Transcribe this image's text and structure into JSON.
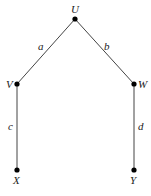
{
  "diagram": {
    "type": "tree",
    "nodes": [
      {
        "id": "U",
        "label": "U",
        "x": 75,
        "y": 19
      },
      {
        "id": "V",
        "label": "V",
        "x": 17,
        "y": 84
      },
      {
        "id": "W",
        "label": "W",
        "x": 134,
        "y": 84
      },
      {
        "id": "X",
        "label": "X",
        "x": 17,
        "y": 170
      },
      {
        "id": "Y",
        "label": "Y",
        "x": 134,
        "y": 170
      }
    ],
    "edges": [
      {
        "from": "U",
        "to": "V",
        "label": "a"
      },
      {
        "from": "U",
        "to": "W",
        "label": "b"
      },
      {
        "from": "V",
        "to": "X",
        "label": "c"
      },
      {
        "from": "W",
        "to": "Y",
        "label": "d"
      }
    ],
    "colors": {
      "line": "#444444",
      "node": "#000000",
      "text": "#222222"
    }
  }
}
